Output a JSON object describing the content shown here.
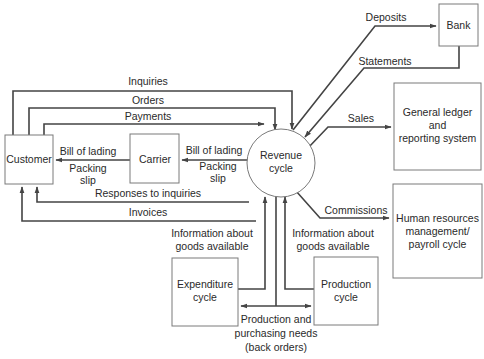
{
  "diagram": {
    "type": "context-diagram",
    "center": {
      "label_line1": "Revenue",
      "label_line2": "cycle"
    },
    "nodes": {
      "customer": {
        "label": "Customer"
      },
      "carrier": {
        "label": "Carrier"
      },
      "bank": {
        "label": "Bank"
      },
      "general_ledger": {
        "line1": "General ledger",
        "line2": "and",
        "line3": "reporting system"
      },
      "hr": {
        "line1": "Human resources",
        "line2": "management/",
        "line3": "payroll cycle"
      },
      "expenditure": {
        "line1": "Expenditure",
        "line2": "cycle"
      },
      "production": {
        "line1": "Production",
        "line2": "cycle"
      }
    },
    "flows": {
      "inquiries": "Inquiries",
      "orders": "Orders",
      "payments": "Payments",
      "bill_of_lading_customer": "Bill of lading",
      "packing_slip_customer_1": "Packing",
      "packing_slip_customer_2": "slip",
      "bill_of_lading_carrier": "Bill of lading",
      "packing_slip_carrier_1": "Packing",
      "packing_slip_carrier_2": "slip",
      "responses": "Responses to inquiries",
      "invoices": "Invoices",
      "deposits": "Deposits",
      "statements": "Statements",
      "sales": "Sales",
      "commissions": "Commissions",
      "info_exp_1": "Information about",
      "info_exp_2": "goods available",
      "info_prod_1": "Information about",
      "info_prod_2": "goods available",
      "needs_1": "Production and",
      "needs_2": "purchasing needs",
      "needs_3": "(back orders)"
    },
    "colors": {
      "line": "#444444",
      "box_border": "#7a7a7a",
      "text": "#2a2a2a",
      "background": "#ffffff"
    }
  }
}
